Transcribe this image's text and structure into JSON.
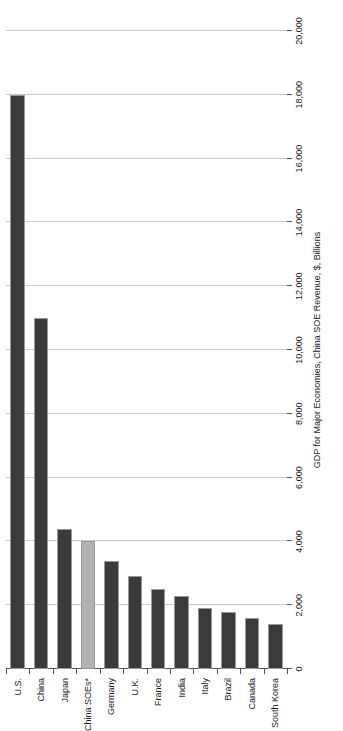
{
  "chart_data": {
    "type": "bar",
    "orientation": "horizontal",
    "title": "",
    "xlabel": "GDP for Major Economies, China SOE Revenue, $, Billions",
    "ylabel": "",
    "xlim": [
      0,
      20000
    ],
    "grid": true,
    "legend": false,
    "tick_labels": [
      "0",
      "2,000",
      "4,000",
      "6,000",
      "8,000",
      "10,000",
      "12,000",
      "14,000",
      "16,000",
      "18,000",
      "20,000"
    ],
    "tick_values": [
      0,
      2000,
      4000,
      6000,
      8000,
      10000,
      12000,
      14000,
      16000,
      18000,
      20000
    ],
    "categories": [
      "U.S.",
      "China",
      "Japan",
      "China SOEs*",
      "Germany",
      "U.K.",
      "France",
      "India",
      "Italy",
      "Brazil",
      "Canada",
      "South Korea"
    ],
    "values": [
      18000,
      11000,
      4400,
      4000,
      3400,
      2900,
      2500,
      2300,
      1900,
      1800,
      1600,
      1400
    ],
    "highlight_category": "China SOEs*",
    "colors": {
      "bar": "#3b3b3b",
      "bar_highlight": "#b3b3b3",
      "grid": "#c9c9c9",
      "axis": "#555555",
      "text": "#1a1a1a",
      "background": "#ffffff"
    }
  }
}
